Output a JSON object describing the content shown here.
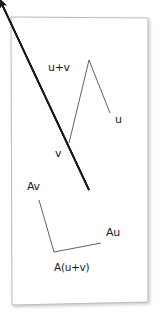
{
  "figure": {
    "kind": "hand-drawn-vector-diagram",
    "medium": "white-paper-sheet",
    "background_color": "#ffffff",
    "ink_color": "#1a1a1a",
    "paper_edge_color": "#b9b9b9",
    "paper_corners": {
      "top_left": {
        "x": 11,
        "y": 17
      },
      "top_right": {
        "x": 148,
        "y": 18
      },
      "bottom_right": {
        "x": 148,
        "y": 302
      },
      "bottom_left": {
        "x": 12,
        "y": 305
      }
    },
    "origin": {
      "x": 89,
      "y": 190
    },
    "vectors": [
      {
        "id": "u",
        "label": "u",
        "label_x": 115,
        "label_y": 123,
        "tip": {
          "x": 110,
          "y": 113
        },
        "group": "upper"
      },
      {
        "id": "v",
        "label": "v",
        "label_x": 55,
        "label_y": 157,
        "tip": {
          "x": 69,
          "y": 143
        },
        "group": "upper"
      },
      {
        "id": "u-plus-v",
        "label": "u+v",
        "label_x": 48,
        "label_y": 71,
        "tip": {
          "x": 89,
          "y": 60
        },
        "group": "upper"
      },
      {
        "id": "Au",
        "label": "Au",
        "label_x": 106,
        "label_y": 236,
        "tip": {
          "x": 101,
          "y": 243
        },
        "group": "lower"
      },
      {
        "id": "Av",
        "label": "Av",
        "label_x": 27,
        "label_y": 190,
        "tip": {
          "x": 39,
          "y": 200
        },
        "group": "lower"
      },
      {
        "id": "A-u-plus-v",
        "label": "A(u+v)",
        "label_x": 54,
        "label_y": 271,
        "tip": {
          "x": 54,
          "y": 252
        },
        "group": "lower"
      }
    ],
    "parallelograms": [
      {
        "id": "upper-parallelogram",
        "points": "89,190 110,113 89,60 69,143"
      },
      {
        "id": "lower-parallelogram",
        "points": "89,190 101,243 54,252 39,200"
      }
    ]
  }
}
